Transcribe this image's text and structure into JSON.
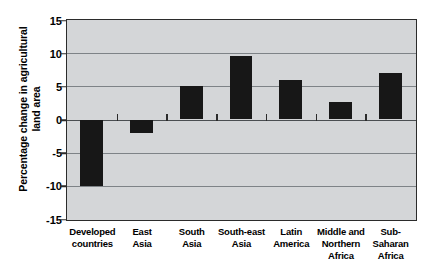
{
  "chart_data": {
    "type": "bar",
    "title": "",
    "xlabel": "",
    "ylabel": "Percentage change in agricultural\nland area",
    "categories": [
      "Developed\ncountries",
      "East\nAsia",
      "South\nAsia",
      "South-east\nAsia",
      "Latin\nAmerica",
      "Middle and\nNorthern\nAfrica",
      "Sub-\nSaharan\nAfrica"
    ],
    "values": [
      -10,
      -2,
      5,
      9.5,
      6,
      2.6,
      7
    ],
    "ylim": [
      -15,
      15
    ],
    "yticks": [
      15,
      10,
      5,
      0,
      -5,
      -10,
      -15
    ],
    "ytick_labels": [
      "15",
      "10",
      "5",
      "0",
      "-5",
      "-10",
      "-15"
    ],
    "grid": true,
    "legend": false,
    "bar_color": "#171717",
    "plot_background": "#d4d6d8",
    "gridline_color": "#7e8387",
    "axis_color": "#2b2b2b"
  }
}
